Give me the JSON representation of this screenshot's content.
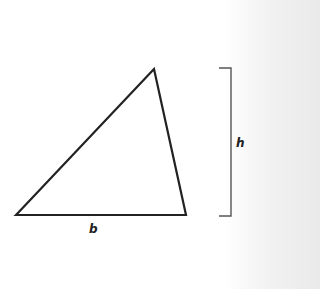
{
  "diagram": {
    "shape": "triangle",
    "vertices": [
      [
        16,
        215
      ],
      [
        154,
        69
      ],
      [
        186,
        215
      ]
    ],
    "base_label": "b",
    "height_label": "h",
    "height_bracket": {
      "x": 231,
      "top": 68,
      "bottom": 216,
      "tick": 12
    },
    "colors": {
      "stroke": "#222222",
      "bracket": "#555555",
      "text": "#222222"
    }
  }
}
